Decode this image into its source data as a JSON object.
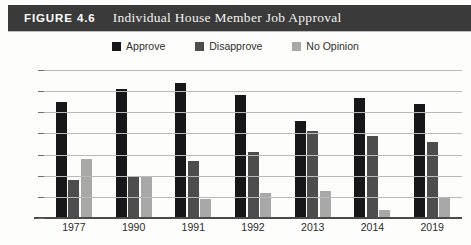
{
  "header": {
    "figure_number": "FIGURE 4.6",
    "title": "Individual House Member Job Approval",
    "band_color": "#3a3a3a"
  },
  "legend": {
    "position": "top-center",
    "items": [
      {
        "label": "Approve",
        "color": "#17171a",
        "swatch_icon": "square-swatch-icon"
      },
      {
        "label": "Disapprove",
        "color": "#4d4d4d",
        "swatch_icon": "square-swatch-icon"
      },
      {
        "label": "No Opinion",
        "color": "#a8a8a8",
        "swatch_icon": "square-swatch-icon"
      }
    ]
  },
  "axis": {
    "y_ticks": [
      "70%",
      "60",
      "50",
      "40",
      "30",
      "20",
      "10",
      "0"
    ],
    "x_labels": [
      "1977",
      "1990",
      "1991",
      "1992",
      "2013",
      "2014",
      "2019"
    ]
  },
  "chart_data": {
    "type": "bar",
    "title": "Individual House Member Job Approval",
    "xlabel": "",
    "ylabel": "",
    "ylim": [
      0,
      70
    ],
    "ytick_step": 10,
    "grid": true,
    "legend_position": "top-center",
    "categories": [
      "1977",
      "1990",
      "1991",
      "1992",
      "2013",
      "2014",
      "2019"
    ],
    "series": [
      {
        "name": "Approve",
        "color": "#17171a",
        "values": [
          55,
          61,
          64,
          58,
          46,
          57,
          54
        ]
      },
      {
        "name": "Disapprove",
        "color": "#4d4d4d",
        "values": [
          18,
          20,
          27,
          31,
          41,
          39,
          36
        ]
      },
      {
        "name": "No Opinion",
        "color": "#a8a8a8",
        "values": [
          28,
          20,
          9,
          12,
          13,
          4,
          10
        ]
      }
    ]
  }
}
